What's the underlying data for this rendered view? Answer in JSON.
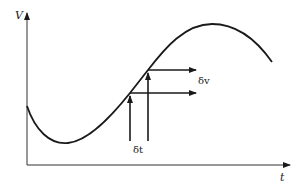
{
  "diagram": {
    "axes": {
      "y_label": "V",
      "x_label": "t"
    },
    "annotations": {
      "delta_v": "δv",
      "delta_t": "δt"
    },
    "curve": {
      "description": "sinusoidal-like wave: starts mid-left, dips to minimum, rises through two sample points, peaks, then declines",
      "points": [
        [
          27,
          108
        ],
        [
          66,
          143
        ],
        [
          130,
          93
        ],
        [
          148,
          70
        ],
        [
          215,
          24
        ],
        [
          270,
          60
        ]
      ]
    },
    "colors": {
      "stroke": "#1a1a1a",
      "background": "#ffffff"
    }
  }
}
